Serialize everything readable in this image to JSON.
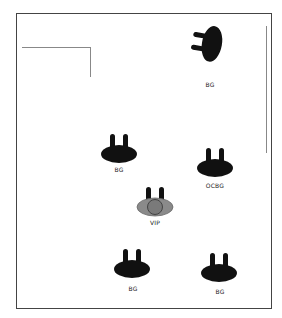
{
  "diagram": {
    "colors": {
      "frame": "#444444",
      "guide_lines": "#888888",
      "marker_fill": "#111111",
      "vip_fill": "#8a8a8a",
      "vip_ring": "#555555"
    },
    "markers": [
      {
        "id": "bg-top",
        "label": "BG",
        "type": "standard",
        "rotation": -90
      },
      {
        "id": "bg-left",
        "label": "BG",
        "type": "standard",
        "rotation": 0
      },
      {
        "id": "ocbg",
        "label": "OCBG",
        "type": "standard",
        "rotation": 0
      },
      {
        "id": "vip",
        "label": "VIP",
        "type": "vip",
        "rotation": 0
      },
      {
        "id": "bg-bottom-left",
        "label": "BG",
        "type": "standard",
        "rotation": 0
      },
      {
        "id": "bg-bottom-right",
        "label": "BG",
        "type": "standard",
        "rotation": 0
      }
    ]
  }
}
